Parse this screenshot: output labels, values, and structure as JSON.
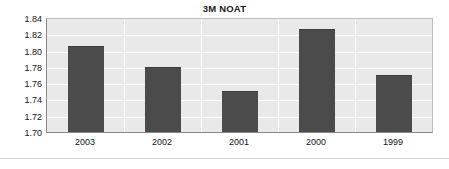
{
  "chart_data": {
    "type": "bar",
    "title": "3M NOAT",
    "subtitle": "",
    "xlabel": "",
    "ylabel": "",
    "categories": [
      "2003",
      "2002",
      "2001",
      "2000",
      "1999"
    ],
    "values": [
      1.806,
      1.78,
      1.751,
      1.828,
      1.771
    ],
    "series": [
      {
        "name": "3M NOAT",
        "values": [
          1.806,
          1.78,
          1.751,
          1.828,
          1.771
        ]
      }
    ],
    "ylim": [
      1.7,
      1.84
    ],
    "ytick_step": 0.02,
    "ytick_labels": [
      "1.84",
      "1.82",
      "1.80",
      "1.78",
      "1.76",
      "1.74",
      "1.72",
      "1.70"
    ],
    "ytick_values": [
      1.84,
      1.82,
      1.8,
      1.78,
      1.76,
      1.74,
      1.72,
      1.7
    ],
    "grid": true,
    "grid_color": "#ffffff",
    "legend": false,
    "legend_position": "none",
    "bar_color": "#4b4b4b",
    "plot_background": "#e9e9e9",
    "page_background": "#ffffff",
    "axis_color": "#8a8a8a"
  }
}
